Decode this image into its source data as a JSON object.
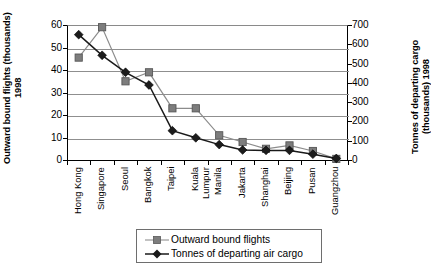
{
  "chart_data": {
    "type": "line",
    "title": "",
    "categories": [
      "Hong Kong",
      "Singapore",
      "Seoul",
      "Bangkok",
      "Taipei",
      "Kuala Lumpur",
      "Manila",
      "Jakarta",
      "Shanghai",
      "Beijing",
      "Pusan",
      "Guangzhou"
    ],
    "series": [
      {
        "name": "Outward bound flights",
        "axis": "left",
        "marker": "square",
        "color": "#8c8c8c",
        "values": [
          45.5,
          59,
          35,
          39,
          23,
          23,
          11,
          8,
          5,
          6.5,
          4,
          0.5
        ]
      },
      {
        "name": "Tonnes of departing air cargo",
        "axis": "right",
        "marker": "diamond",
        "color": "#1a1a1a",
        "values": [
          650,
          543,
          455,
          389,
          152,
          115,
          80,
          52,
          50,
          50,
          30,
          8
        ]
      }
    ],
    "left_axis": {
      "label": "Outward bound flights (thousands)\n1998",
      "ticks": [
        "0",
        "10",
        "20",
        "30",
        "40",
        "50",
        "60"
      ],
      "min": 0,
      "max": 60
    },
    "right_axis": {
      "label": "Tonnes of departing cargo\n(thousands) 1998",
      "ticks": [
        "0",
        "100",
        "200",
        "300",
        "400",
        "500",
        "600",
        "700"
      ],
      "min": 0,
      "max": 700
    },
    "xlabel": "",
    "grid": true,
    "legend_position": "bottom"
  },
  "legend": {
    "items": [
      {
        "label": "Outward bound flights"
      },
      {
        "label": "Tonnes of departing air cargo"
      }
    ]
  }
}
